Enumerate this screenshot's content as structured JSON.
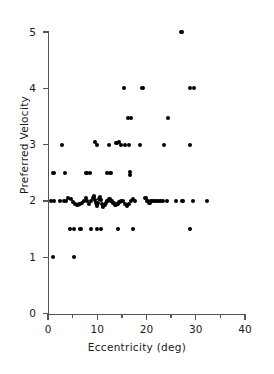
{
  "figure": {
    "background": "#ffffff",
    "ink_color": "#000000",
    "axis_color": "#555555"
  },
  "chart_data": {
    "type": "scatter",
    "title": "",
    "xlabel": "Eccentricity  (deg)",
    "ylabel": "Preferred  Velocity",
    "xlim": [
      0,
      40
    ],
    "ylim": [
      0,
      5
    ],
    "grid": false,
    "legend": null,
    "x_ticks": [
      0,
      10,
      20,
      30,
      40
    ],
    "x_tick_labels": [
      "0",
      "10",
      "20",
      "30",
      "40"
    ],
    "x_minor_ticks": [
      5,
      15,
      25,
      35
    ],
    "y_ticks": [
      0,
      1,
      2,
      3,
      4,
      5
    ],
    "y_tick_labels": [
      "0",
      "1",
      "2",
      "3",
      "4",
      "5"
    ],
    "y_minor_ticks": [],
    "marker": "filled-circle",
    "marker_size_px": 4.2,
    "n_points": 97,
    "points": [
      [
        1.0,
        1.0
      ],
      [
        5.3,
        1.0
      ],
      [
        4.4,
        1.5
      ],
      [
        5.2,
        1.5
      ],
      [
        6.6,
        1.5
      ],
      [
        8.7,
        1.5
      ],
      [
        10.0,
        1.5
      ],
      [
        10.8,
        1.5
      ],
      [
        14.2,
        1.5
      ],
      [
        17.3,
        1.5
      ],
      [
        28.9,
        1.5
      ],
      [
        0.6,
        2.0
      ],
      [
        1.2,
        2.0
      ],
      [
        2.5,
        2.0
      ],
      [
        3.2,
        2.0
      ],
      [
        3.7,
        2.0
      ],
      [
        4.1,
        2.05
      ],
      [
        4.6,
        2.03
      ],
      [
        5.0,
        1.98
      ],
      [
        5.4,
        1.95
      ],
      [
        6.0,
        1.93
      ],
      [
        6.4,
        1.95
      ],
      [
        6.9,
        1.97
      ],
      [
        7.3,
        2.0
      ],
      [
        7.7,
        2.05
      ],
      [
        8.0,
        2.0
      ],
      [
        8.4,
        1.95
      ],
      [
        8.8,
        2.0
      ],
      [
        9.1,
        2.05
      ],
      [
        9.4,
        2.08
      ],
      [
        9.6,
        2.02
      ],
      [
        9.8,
        1.96
      ],
      [
        10.0,
        1.92
      ],
      [
        10.2,
        1.97
      ],
      [
        10.4,
        2.03
      ],
      [
        10.6,
        2.07
      ],
      [
        10.8,
        2.02
      ],
      [
        11.0,
        1.95
      ],
      [
        11.2,
        1.9
      ],
      [
        11.5,
        1.93
      ],
      [
        11.8,
        1.97
      ],
      [
        12.1,
        2.0
      ],
      [
        12.5,
        2.03
      ],
      [
        12.9,
        2.0
      ],
      [
        13.3,
        1.96
      ],
      [
        13.7,
        1.93
      ],
      [
        14.1,
        1.95
      ],
      [
        14.5,
        1.98
      ],
      [
        14.9,
        2.0
      ],
      [
        15.3,
        2.0
      ],
      [
        15.7,
        1.95
      ],
      [
        16.0,
        1.92
      ],
      [
        16.4,
        1.95
      ],
      [
        16.8,
        2.0
      ],
      [
        17.2,
        2.03
      ],
      [
        17.6,
        2.0
      ],
      [
        19.8,
        2.05
      ],
      [
        20.2,
        2.0
      ],
      [
        20.6,
        1.97
      ],
      [
        21.0,
        2.0
      ],
      [
        21.4,
        2.0
      ],
      [
        21.8,
        2.0
      ],
      [
        22.2,
        2.0
      ],
      [
        22.6,
        2.0
      ],
      [
        23.0,
        2.0
      ],
      [
        23.4,
        2.0
      ],
      [
        24.2,
        2.0
      ],
      [
        26.0,
        2.0
      ],
      [
        27.3,
        2.0
      ],
      [
        29.5,
        2.0
      ],
      [
        32.3,
        2.0
      ],
      [
        1.1,
        2.5
      ],
      [
        3.4,
        2.5
      ],
      [
        7.8,
        2.5
      ],
      [
        8.6,
        2.5
      ],
      [
        11.9,
        2.5
      ],
      [
        12.7,
        2.5
      ],
      [
        16.6,
        2.52
      ],
      [
        16.6,
        2.46
      ],
      [
        2.9,
        3.0
      ],
      [
        9.5,
        3.05
      ],
      [
        9.9,
        3.0
      ],
      [
        12.4,
        3.0
      ],
      [
        13.9,
        3.03
      ],
      [
        14.4,
        3.05
      ],
      [
        14.8,
        3.0
      ],
      [
        15.6,
        3.0
      ],
      [
        16.4,
        3.0
      ],
      [
        18.7,
        3.0
      ],
      [
        23.6,
        3.0
      ],
      [
        28.8,
        3.0
      ],
      [
        16.3,
        3.48
      ],
      [
        16.8,
        3.48
      ],
      [
        24.3,
        3.48
      ],
      [
        15.5,
        4.0
      ],
      [
        19.2,
        4.0
      ],
      [
        28.8,
        4.0
      ],
      [
        29.6,
        4.0
      ],
      [
        27.1,
        5.0
      ]
    ]
  }
}
